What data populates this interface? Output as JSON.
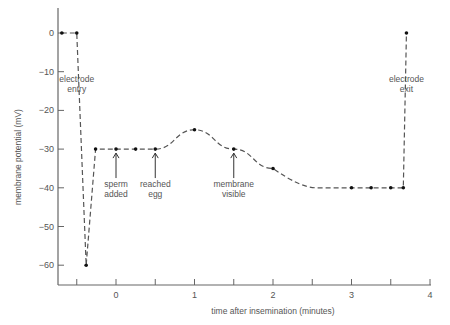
{
  "chart_data": {
    "type": "line",
    "title": "",
    "xlabel": "time after insemination (minutes)",
    "ylabel": "membrane potential (mV)",
    "xlim": [
      -0.75,
      4.05
    ],
    "ylim": [
      -65,
      3
    ],
    "x_ticks": [
      -0.5,
      0,
      0.5,
      1,
      1.5,
      2,
      2.5,
      3,
      3.5,
      4
    ],
    "x_tick_labels": [
      "",
      "0",
      "",
      "1",
      "",
      "2",
      "",
      "3",
      "",
      "4"
    ],
    "y_ticks": [
      0,
      -10,
      -20,
      -30,
      -40,
      -50,
      -60
    ],
    "y_tick_labels": [
      "0",
      "−10",
      "−20",
      "−30",
      "−40",
      "−50",
      "−60"
    ],
    "grid": false,
    "legend": null,
    "line_style": "dashed",
    "series": [
      {
        "name": "membrane potential",
        "x": [
          -0.69,
          -0.5,
          -0.38,
          -0.26,
          0.0,
          0.25,
          0.5,
          1.0,
          1.5,
          2.0,
          3.0,
          3.25,
          3.5,
          3.66,
          3.7
        ],
        "y": [
          0,
          0,
          -60,
          -30,
          -30,
          -30,
          -30,
          -25,
          -30,
          -35,
          -40,
          -40,
          -40,
          -40,
          0
        ]
      }
    ],
    "annotations": [
      {
        "text": [
          "electrode",
          "entry"
        ],
        "x": -0.5,
        "y": -12,
        "arrow": false
      },
      {
        "text": [
          "sperm",
          "added"
        ],
        "x": 0.0,
        "y": -38,
        "arrow": true,
        "arrow_to": -30
      },
      {
        "text": [
          "reached",
          "egg"
        ],
        "x": 0.5,
        "y": -38,
        "arrow": true,
        "arrow_to": -30
      },
      {
        "text": [
          "membrane",
          "visible"
        ],
        "x": 1.5,
        "y": -38,
        "arrow": true,
        "arrow_to": -30
      },
      {
        "text": [
          "electrode",
          "exit"
        ],
        "x": 3.7,
        "y": -12,
        "arrow": false
      }
    ]
  }
}
